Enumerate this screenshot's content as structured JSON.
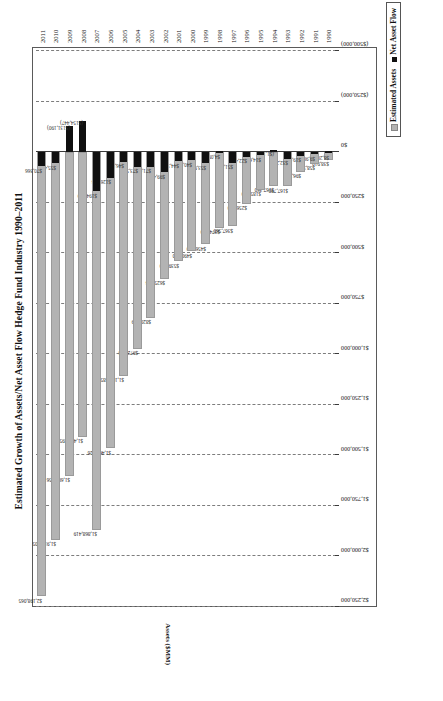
{
  "chart_data": {
    "type": "bar",
    "title": "Estimated Growth of Assets/Net Asset Flow Hedge Fund Industry 1990–2011",
    "xlabel": "",
    "ylabel": "Assets ($MM)",
    "orientation": "horizontal",
    "grid": true,
    "legend_position": "bottom-right",
    "xlim": [
      -500000,
      2250000
    ],
    "axis_ticks": [
      "$2,250,000",
      "$2,000,000",
      "$1,750,000",
      "$1,500,000",
      "$1,250,000",
      "$1,000,000",
      "$750,000",
      "$500,000",
      "$250,000",
      "$0",
      "($250,000)",
      "($500,000)"
    ],
    "axis_tick_values": [
      2250000,
      2000000,
      1750000,
      1500000,
      1250000,
      1000000,
      750000,
      500000,
      250000,
      0,
      -250000,
      -500000
    ],
    "categories": [
      "1990",
      "1991",
      "1992",
      "1993",
      "1994",
      "1995",
      "1996",
      "1997",
      "1998",
      "1999",
      "2000",
      "2001",
      "2002",
      "2003",
      "2004",
      "2005",
      "2006",
      "2007",
      "2008",
      "2009",
      "2010",
      "2011"
    ],
    "series": [
      {
        "name": "Estimated Assets",
        "color": "#b3b3b3",
        "values": [
          38910,
          58370,
          96720,
          167790,
          167360,
          185750,
          256720,
          367560,
          374770,
          456430,
          490590,
          539060,
          625554,
          820009,
          972608,
          1105385,
          1464526,
          1868419,
          1407895,
          1600156,
          1917305,
          2198065
        ],
        "labels": [
          "$38,910",
          "$58,370",
          "$96,720",
          "$167,790",
          "$167,360",
          "$185,750",
          "$256,720",
          "$367,560",
          "$374,770",
          "$456,430",
          "$490,590",
          "$539,060",
          "$625,554",
          "$820,009",
          "$972,608",
          "$1,105,385",
          "$1,464,526",
          "$1,868,419",
          "$1,407,895",
          "$1,600,156",
          "$1,917,305",
          "$2,198,065"
        ]
      },
      {
        "name": "Net Asset Flow",
        "color": "#101010",
        "values": [
          6200,
          9900,
          19000,
          32200,
          -1141,
          14699,
          22487,
          51831,
          4099,
          53991,
          40096,
          44365,
          99486,
          71635,
          73585,
          46987,
          126874,
          194819,
          -154447,
          -131190,
          55464,
          70366
        ],
        "labels": [
          "$6,200",
          "$9,900",
          "$19,000",
          "$32,200",
          "($1,141)",
          "$14,699",
          "$22,487",
          "$51,831",
          "$4,099",
          "$53,991",
          "$40,096",
          "$44,365",
          "$99,486",
          "$71,635",
          "$73,585",
          "$46,987",
          "$126,874",
          "$194,819",
          "($154,447)",
          "($131,190)",
          "$55,464",
          "$70,366"
        ]
      }
    ]
  },
  "legend": {
    "assets_label": "Estimated Assets",
    "flow_label": "Net Asset Flow"
  }
}
